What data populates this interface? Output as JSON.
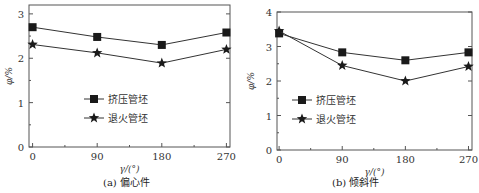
{
  "chart_data": [
    {
      "type": "line",
      "caption": "(a) 偏心件",
      "title": "",
      "xlabel": "γ/(°)",
      "ylabel": "φ/%",
      "x": [
        0,
        90,
        180,
        270
      ],
      "xticks": [
        "0",
        "90",
        "180",
        "270"
      ],
      "yticks": [
        "0",
        "1",
        "2",
        "3"
      ],
      "ylim": [
        0,
        3.2
      ],
      "xlim": [
        -5,
        275
      ],
      "grid": false,
      "legend_position": "center-left inside",
      "series": [
        {
          "name": "挤压管坯",
          "marker": "square",
          "values": [
            2.7,
            2.48,
            2.3,
            2.58
          ]
        },
        {
          "name": "退火管坯",
          "marker": "star",
          "values": [
            2.31,
            2.12,
            1.89,
            2.2
          ]
        }
      ]
    },
    {
      "type": "line",
      "caption": "(b) 倾斜件",
      "title": "",
      "xlabel": "γ/(°)",
      "ylabel": "φ/%",
      "x": [
        0,
        90,
        180,
        270
      ],
      "xticks": [
        "0",
        "90",
        "180",
        "270"
      ],
      "yticks": [
        "0",
        "1",
        "2",
        "3",
        "4"
      ],
      "ylim": [
        0,
        4
      ],
      "xlim": [
        -3,
        275
      ],
      "grid": false,
      "legend_position": "center-left inside",
      "series": [
        {
          "name": "挤压管坯",
          "marker": "square",
          "values": [
            3.38,
            2.83,
            2.6,
            2.83
          ]
        },
        {
          "name": "退火管坯",
          "marker": "star",
          "values": [
            3.45,
            2.45,
            2.0,
            2.42
          ]
        }
      ]
    }
  ]
}
